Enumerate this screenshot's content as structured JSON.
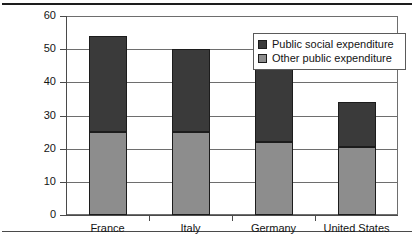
{
  "chart_data": {
    "type": "bar",
    "subtype": "stacked-vertical",
    "title": "",
    "xlabel": "",
    "ylabel": "",
    "categories": [
      "France",
      "Italy",
      "Germany",
      "United States"
    ],
    "series": [
      {
        "name": "Other public expenditure",
        "color": "#8d8d8d",
        "values": [
          25,
          25,
          22,
          20.5
        ]
      },
      {
        "name": "Public social expenditure",
        "color": "#3a3a3a",
        "values": [
          29,
          25,
          25.5,
          13.5
        ]
      }
    ],
    "stack_order": [
      "Other public expenditure",
      "Public social expenditure"
    ],
    "totals": [
      54,
      50,
      47.5,
      34
    ],
    "ylim": [
      0,
      60
    ],
    "yticks": [
      0,
      10,
      20,
      30,
      40,
      50,
      60
    ],
    "ytick_labels": [
      "0",
      "10",
      "20",
      "30",
      "40",
      "50",
      "60"
    ],
    "grid": true,
    "grid_axis": "y",
    "legend_position": "top-right-inside",
    "legend_entries": [
      "Public social expenditure",
      "Other public expenditure"
    ]
  },
  "legend": {
    "entries": [
      {
        "label": "Public social expenditure",
        "swatch": "#3a3a3a"
      },
      {
        "label": "Other public expenditure",
        "swatch": "#8d8d8d"
      }
    ]
  },
  "colors": {
    "social": "#3a3a3a",
    "other": "#8d8d8d",
    "axis": "#4a4a4a",
    "grid": "#6e6e6e",
    "text": "#141414",
    "background": "#ffffff"
  }
}
